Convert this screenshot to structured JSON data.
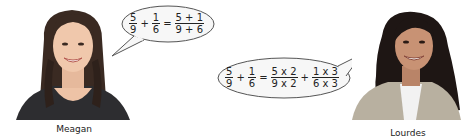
{
  "people": [
    {
      "name": "Meagan",
      "equation": {
        "lhs": [
          {
            "num": "5",
            "den": "9"
          },
          {
            "num": "1",
            "den": "6"
          }
        ],
        "operator": "+",
        "equals": "=",
        "rhs": [
          {
            "num": "5 + 1",
            "den": "9 + 6"
          }
        ]
      }
    },
    {
      "name": "Lourdes",
      "equation": {
        "lhs": [
          {
            "num": "5",
            "den": "9"
          },
          {
            "num": "1",
            "den": "6"
          }
        ],
        "operator": "+",
        "equals": "=",
        "rhs": [
          {
            "num": "5 x 2",
            "den": "9 x 2"
          },
          {
            "num": "1 x 3",
            "den": "6 x 3"
          }
        ],
        "rhs_operator": "+"
      }
    }
  ],
  "colors": {
    "bubble_fill": "#f7f7f7",
    "bubble_stroke": "#555555",
    "text": "#222222"
  }
}
